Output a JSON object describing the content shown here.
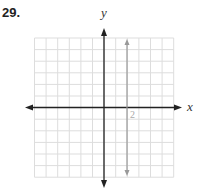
{
  "problem_number": "29.",
  "axes": {
    "x_label": "x",
    "y_label": "y"
  },
  "chart_data": {
    "type": "line",
    "title": "29.",
    "xlabel": "x",
    "ylabel": "y",
    "xlim": [
      -6,
      6
    ],
    "ylim": [
      -6,
      6
    ],
    "grid": true,
    "annotations": [
      {
        "text": "2",
        "x": 2,
        "y": -0.5
      }
    ],
    "series": [
      {
        "name": "x = 2",
        "x": [
          2,
          2
        ],
        "y": [
          -5.5,
          5.5
        ],
        "color": "#999999"
      }
    ]
  },
  "colors": {
    "grid": "#dddddd",
    "axis": "#222222",
    "line": "#999999"
  },
  "tick_label": "2"
}
